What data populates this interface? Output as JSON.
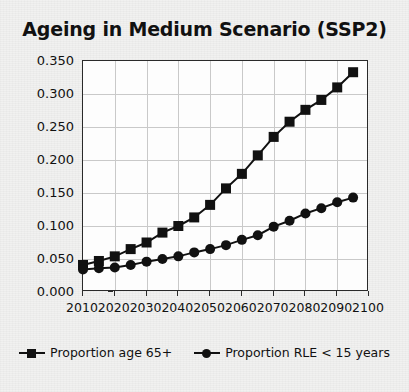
{
  "chart_data": {
    "type": "line",
    "title": "Ageing in Medium Scenario (SSP2)",
    "xlabel": "",
    "ylabel": "Proportion",
    "xlim": [
      2010,
      2100
    ],
    "ylim": [
      0.0,
      0.35
    ],
    "grid": true,
    "legend_position": "bottom",
    "xticks": [
      "2010",
      "2020",
      "2030",
      "2040",
      "2050",
      "2060",
      "2070",
      "2080",
      "2090",
      "2100"
    ],
    "yticks": [
      "0.000",
      "0.050",
      "0.100",
      "0.150",
      "0.200",
      "0.250",
      "0.300",
      "0.350"
    ],
    "x": [
      2010,
      2015,
      2020,
      2025,
      2030,
      2035,
      2040,
      2045,
      2050,
      2055,
      2060,
      2065,
      2070,
      2075,
      2080,
      2085,
      2090,
      2095
    ],
    "series": [
      {
        "name": "Proportion age 65+",
        "marker": "square",
        "color": "#111111",
        "values": [
          0.041,
          0.047,
          0.054,
          0.065,
          0.075,
          0.09,
          0.1,
          0.113,
          0.132,
          0.157,
          0.179,
          0.207,
          0.235,
          0.258,
          0.276,
          0.291,
          0.31,
          0.333
        ]
      },
      {
        "name": "Proportion RLE < 15 years",
        "marker": "circle",
        "color": "#111111",
        "values": [
          0.034,
          0.036,
          0.037,
          0.041,
          0.046,
          0.05,
          0.054,
          0.06,
          0.065,
          0.071,
          0.079,
          0.086,
          0.099,
          0.108,
          0.119,
          0.127,
          0.136,
          0.143
        ]
      }
    ]
  },
  "legend": {
    "items": [
      {
        "label": "Proportion age 65+",
        "marker": "square"
      },
      {
        "label": "Proportion RLE < 15 years",
        "marker": "circle"
      }
    ]
  },
  "colors": {
    "ink": "#111111",
    "grid": "#c9c9c9",
    "frame": "#2a2a2a",
    "paper": "#f1f1f0",
    "plot_background": "#fdfdfd"
  }
}
